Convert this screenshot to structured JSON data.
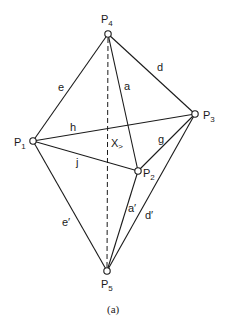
{
  "caption": "(a)",
  "vertices": [
    {
      "id": "P1",
      "base": "P",
      "sub": "1",
      "x": 33,
      "y": 141
    },
    {
      "id": "P2",
      "base": "P",
      "sub": "2",
      "x": 138,
      "y": 171
    },
    {
      "id": "P3",
      "base": "P",
      "sub": "3",
      "x": 195,
      "y": 114
    },
    {
      "id": "P4",
      "base": "P",
      "sub": "4",
      "x": 108,
      "y": 34
    },
    {
      "id": "P5",
      "base": "P",
      "sub": "5",
      "x": 107,
      "y": 271
    }
  ],
  "edges": [
    {
      "from": "P1",
      "to": "P4",
      "label": "e"
    },
    {
      "from": "P4",
      "to": "P3",
      "label": "d"
    },
    {
      "from": "P4",
      "to": "P2",
      "label": "a"
    },
    {
      "from": "P1",
      "to": "P3",
      "label": "h"
    },
    {
      "from": "P1",
      "to": "P2",
      "label": "j"
    },
    {
      "from": "P2",
      "to": "P3",
      "label": "g"
    },
    {
      "from": "P1",
      "to": "P5",
      "label": "e′"
    },
    {
      "from": "P2",
      "to": "P5",
      "label": "a′"
    },
    {
      "from": "P3",
      "to": "P5",
      "label": "d′"
    }
  ],
  "dashed_axis": {
    "from": "P4",
    "to": "P5"
  },
  "axis_label": {
    "text": "X",
    "arrow": ">"
  },
  "labels": {
    "e": "e",
    "d": "d",
    "a": "a",
    "h": "h",
    "j": "j",
    "g": "g",
    "e_prime": "e′",
    "a_prime": "a′",
    "d_prime": "d′",
    "x": "X",
    "x_arrow": ">"
  }
}
